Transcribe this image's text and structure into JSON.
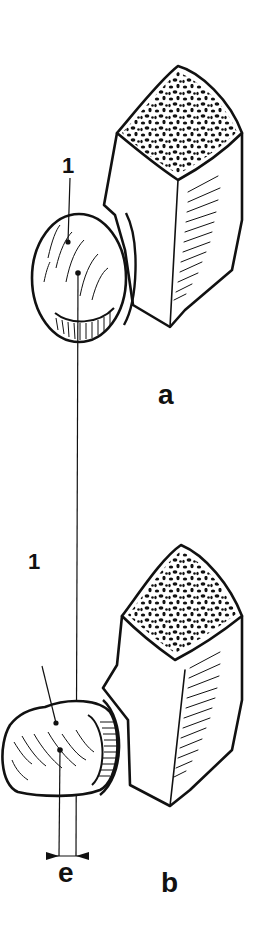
{
  "figure": {
    "type": "anatomical line illustration",
    "panels": [
      {
        "id": "a",
        "label": "a",
        "callout": "1",
        "description": "Oval structure (1) adjacent to rectangular bone segment with cancellous cut surface; reference line drawn vertically from center point"
      },
      {
        "id": "b",
        "label": "b",
        "callout": "1",
        "description": "Rotated/flattened oval structure (1) adjacent to bone segment; center point offset from reference line by distance e"
      }
    ],
    "dimension": {
      "label": "e",
      "meaning": "horizontal offset between reference line and center point"
    },
    "colors": {
      "ink": "#111111",
      "background": "#ffffff"
    }
  }
}
